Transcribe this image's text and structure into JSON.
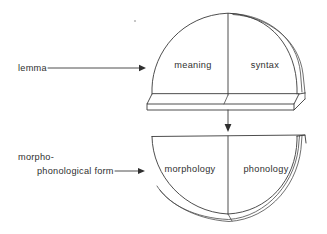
{
  "diagram": {
    "background_color": "#ffffff",
    "line_color": "#3a3a3a",
    "text_color": "#2f2f2f"
  },
  "labels": {
    "lemma": "lemma",
    "form_line1": "morpho-",
    "form_line2": "phonological form"
  },
  "upper_node": {
    "name": "lemma",
    "shape": "dome",
    "left_region": "meaning",
    "right_region": "syntax"
  },
  "lower_node": {
    "name": "morpho-phonological form",
    "shape": "bowl",
    "left_region": "morphology",
    "right_region": "phonology"
  },
  "connectors": {
    "lemma_arrow": "lemma-pointer-arrow",
    "form_arrow": "form-pointer-arrow",
    "vertical_arrow": "lemma-to-form-arrow"
  }
}
